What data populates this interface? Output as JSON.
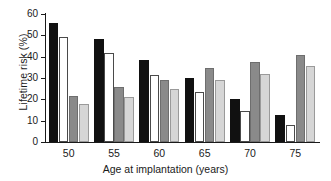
{
  "chart_data": {
    "type": "bar",
    "title": "",
    "xlabel": "Age at implantation (years)",
    "ylabel": "Lifetime risk (%)",
    "categories": [
      "50",
      "55",
      "60",
      "65",
      "70",
      "75"
    ],
    "ylim": [
      0,
      60
    ],
    "yticks": [
      0,
      10,
      20,
      30,
      40,
      50,
      60
    ],
    "ytick_labels": [
      "0",
      "10",
      "20",
      "30",
      "40",
      "50",
      "60"
    ],
    "grid": false,
    "legend": "none",
    "series": [
      {
        "name": "series-1",
        "style": "black",
        "color": "#111111",
        "values": [
          56,
          48.5,
          38.5,
          30,
          20,
          12.5
        ]
      },
      {
        "name": "series-2",
        "style": "white",
        "color": "#ffffff",
        "values": [
          49,
          41.5,
          31.5,
          23.5,
          14.5,
          8
        ]
      },
      {
        "name": "series-3",
        "style": "dark-gray",
        "color": "#8a8a8a",
        "values": [
          21.5,
          26,
          29,
          34.5,
          37.5,
          41
        ]
      },
      {
        "name": "series-4",
        "style": "light-gray",
        "color": "#d6d6d6",
        "values": [
          18,
          21,
          25,
          29,
          32,
          35.5
        ]
      }
    ]
  }
}
